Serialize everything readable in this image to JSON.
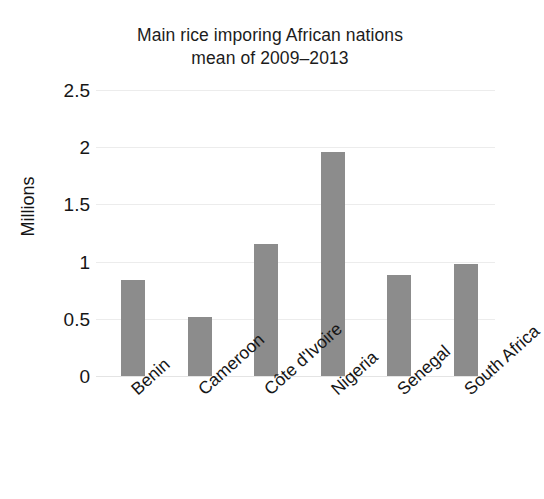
{
  "chart_data": {
    "type": "bar",
    "title": "Main rice imporing African nations\nmean of 2009–2013",
    "title_line1": "Main rice imporing African nations",
    "title_line2": "mean of 2009–2013",
    "xlabel": "",
    "ylabel": "Millions",
    "ylim": [
      0,
      2.5
    ],
    "yticks": [
      "0",
      "0.5",
      "1",
      "1.5",
      "2",
      "2.5"
    ],
    "ytick_values": [
      0,
      0.5,
      1,
      1.5,
      2,
      2.5
    ],
    "grid": true,
    "legend": false,
    "bar_color": "#8c8c8c",
    "grid_color": "#ececec",
    "categories": [
      "Benin",
      "Cameroon",
      "Côte d'Ivoire",
      "Nigeria",
      "Senegal",
      "South Africa"
    ],
    "values": [
      0.84,
      0.52,
      1.15,
      1.96,
      0.88,
      0.98
    ]
  }
}
